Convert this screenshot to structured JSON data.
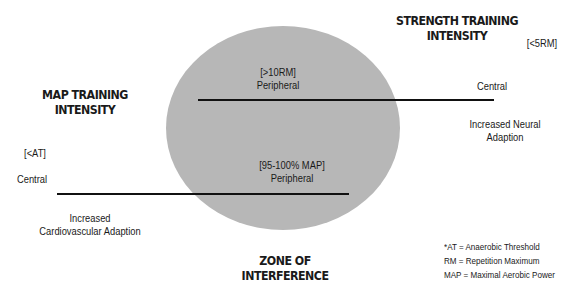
{
  "colors": {
    "zone_fill": "#b7b7b7",
    "line": "#111111",
    "text": "#1a1a1a",
    "background": "#ffffff"
  },
  "strength": {
    "title_line1": "STRENGTH TRAINING",
    "title_line2": "INTENSITY",
    "range": "[<5RM]",
    "high_label": "[>10RM]",
    "high_sub": "Peripheral",
    "end_label": "Central",
    "outcome_line1": "Increased Neural",
    "outcome_line2": "Adaption"
  },
  "map": {
    "title_line1": "MAP TRAINING",
    "title_line2": "INTENSITY",
    "range": "[<AT]",
    "start_label": "Central",
    "high_label": "[95-100% MAP]",
    "high_sub": "Peripheral",
    "outcome_line1": "Increased",
    "outcome_line2": "Cardiovascular Adaption"
  },
  "zone": {
    "label": "ZONE OF INTERFERENCE"
  },
  "legend": [
    "*AT = Anaerobic Threshold",
    "RM = Repetition Maximum",
    "MAP = Maximal Aerobic Power"
  ]
}
